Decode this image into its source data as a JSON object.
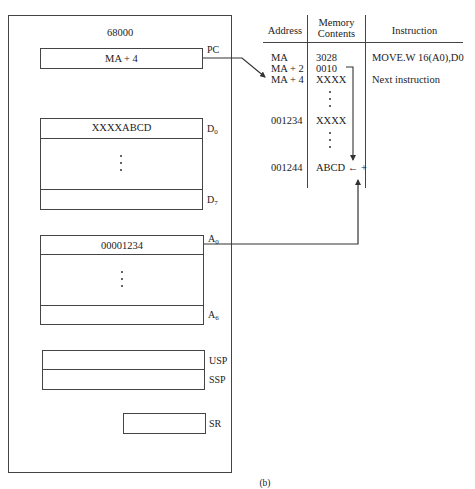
{
  "figure": {
    "caption": "(b)"
  },
  "cpu": {
    "title": "68000",
    "pc": {
      "label": "PC",
      "value": "MA + 4"
    },
    "data_registers": {
      "first": {
        "label": "D",
        "sub": "0",
        "value": "XXXXABCD"
      },
      "last": {
        "label": "D",
        "sub": "7",
        "value": ""
      },
      "ellipsis": "⋮"
    },
    "address_registers": {
      "first": {
        "label": "A",
        "sub": "0",
        "value": "00001234"
      },
      "last": {
        "label": "A",
        "sub": "6",
        "value": ""
      },
      "ellipsis": "⋮"
    },
    "stack_pointers": [
      {
        "label": "USP",
        "value": ""
      },
      {
        "label": "SSP",
        "value": ""
      }
    ],
    "sr": {
      "label": "SR",
      "value": ""
    }
  },
  "memory_table": {
    "headers": {
      "address": "Address",
      "contents_line1": "Memory",
      "contents_line2": "Contents",
      "instruction": "Instruction"
    },
    "rows": [
      {
        "address": "MA",
        "contents": "3028",
        "instruction": "MOVE.W 16(A0),D0"
      },
      {
        "address": "MA + 2",
        "contents": "0010",
        "instruction": ""
      },
      {
        "address": "MA + 4",
        "contents": "XXXX",
        "instruction": "Next instruction"
      },
      {
        "address": "001234",
        "contents": "XXXX",
        "instruction": ""
      },
      {
        "address": "001244",
        "contents": "ABCD ← +",
        "instruction": ""
      }
    ]
  },
  "arrows": {
    "pc_to_memory": "PC points to MA + 4",
    "a0_plus_offset": "A0 (00001234) + displacement 0010 = 001244"
  }
}
